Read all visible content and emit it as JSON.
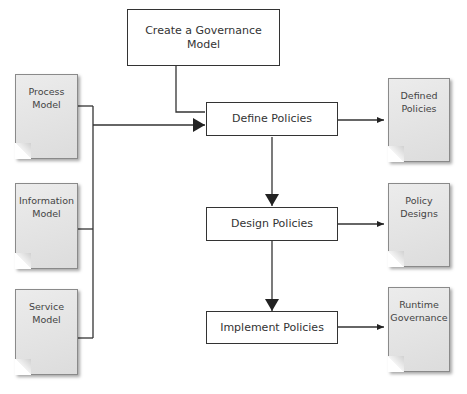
{
  "diagram": {
    "process_boxes": [
      {
        "id": "governance",
        "label": "Create a Governance Model"
      },
      {
        "id": "define",
        "label": "Define Policies"
      },
      {
        "id": "design",
        "label": "Design Policies"
      },
      {
        "id": "implement",
        "label": "Implement Policies"
      }
    ],
    "input_documents": [
      {
        "id": "process",
        "line1": "Process",
        "line2": "Model"
      },
      {
        "id": "information",
        "line1": "Information",
        "line2": "Model"
      },
      {
        "id": "service",
        "line1": "Service",
        "line2": "Model"
      }
    ],
    "output_documents": [
      {
        "id": "defined",
        "line1": "Defined",
        "line2": "Policies"
      },
      {
        "id": "designs",
        "line1": "Policy",
        "line2": "Designs"
      },
      {
        "id": "runtime",
        "line1": "Runtime",
        "line2": "Governance"
      }
    ],
    "edges": [
      {
        "from": "governance",
        "to": "define"
      },
      {
        "from": "process",
        "to": "define"
      },
      {
        "from": "information",
        "to": "define"
      },
      {
        "from": "service",
        "to": "define"
      },
      {
        "from": "define",
        "to": "design"
      },
      {
        "from": "design",
        "to": "implement"
      },
      {
        "from": "define",
        "to": "defined"
      },
      {
        "from": "design",
        "to": "designs"
      },
      {
        "from": "implement",
        "to": "runtime"
      }
    ]
  }
}
